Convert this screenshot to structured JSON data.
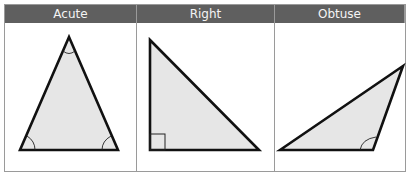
{
  "headers": [
    {
      "label": "Acute"
    },
    {
      "label": "Right"
    },
    {
      "label": "Obtuse"
    }
  ],
  "colors": {
    "header_bg": "#5f5f5f",
    "header_text": "#f4f4f4",
    "triangle_fill": "#e6e6e6",
    "stroke": "#111111",
    "grid": "#9a9a9a"
  },
  "triangles": [
    {
      "type": "acute",
      "marks": [
        "angle-arc-top",
        "angle-arc-bottom-left",
        "angle-arc-bottom-right"
      ]
    },
    {
      "type": "right",
      "marks": [
        "right-angle-square-bottom-left"
      ]
    },
    {
      "type": "obtuse",
      "marks": [
        "angle-arc-bottom-right"
      ]
    }
  ]
}
